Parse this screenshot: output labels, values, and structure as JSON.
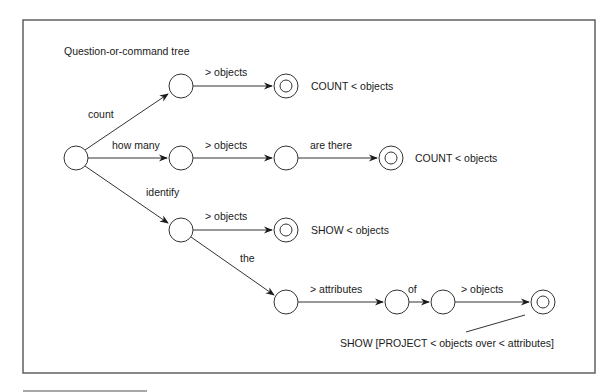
{
  "title": "Question-or-command tree",
  "edges": {
    "count": "count",
    "how_many": "how many",
    "identify": "identify",
    "top_objects": "> objects",
    "mid_objects": "> objects",
    "are_there": "are there",
    "id_objects": "> objects",
    "the": "the",
    "attributes": "> attributes",
    "of": "of",
    "bottom_objects": "> objects"
  },
  "outputs": {
    "count_top": "COUNT < objects",
    "count_mid": "COUNT < objects",
    "show_objects": "SHOW < objects",
    "show_project": "SHOW [PROJECT < objects over < attributes]"
  }
}
